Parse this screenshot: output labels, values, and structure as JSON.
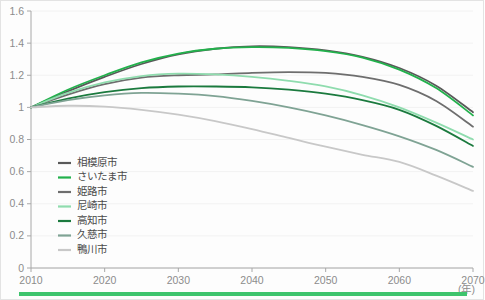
{
  "chart_data": {
    "type": "line",
    "title": "",
    "xlabel": "(年)",
    "ylabel": "",
    "xlim": [
      2010,
      2070
    ],
    "ylim": [
      0,
      1.6
    ],
    "x_ticks": [
      "2010",
      "2020",
      "2030",
      "2040",
      "2050",
      "2060",
      "2070"
    ],
    "x_tick_values": [
      2010,
      2020,
      2030,
      2040,
      2050,
      2060,
      2070
    ],
    "y_ticks": [
      "0",
      "0.2",
      "0.4",
      "0.6",
      "0.8",
      "1",
      "1.2",
      "1.4",
      "1.6"
    ],
    "y_tick_values": [
      0,
      0.2,
      0.4,
      0.6,
      0.8,
      1.0,
      1.2,
      1.4,
      1.6
    ],
    "grid": true,
    "legend_position": "lower-left-inside",
    "x": [
      2010,
      2015,
      2020,
      2025,
      2030,
      2035,
      2040,
      2045,
      2050,
      2055,
      2060,
      2065,
      2070
    ],
    "series": [
      {
        "name": "相模原市",
        "color": "#595959",
        "values": [
          1.0,
          1.1,
          1.19,
          1.27,
          1.33,
          1.365,
          1.38,
          1.375,
          1.355,
          1.315,
          1.245,
          1.135,
          0.97
        ]
      },
      {
        "name": "さいたま市",
        "color": "#22b14c",
        "values": [
          1.0,
          1.11,
          1.2,
          1.28,
          1.335,
          1.365,
          1.375,
          1.37,
          1.35,
          1.31,
          1.235,
          1.12,
          0.95
        ]
      },
      {
        "name": "姫路市",
        "color": "#6e6e6e",
        "values": [
          1.0,
          1.08,
          1.145,
          1.185,
          1.2,
          1.205,
          1.215,
          1.22,
          1.215,
          1.19,
          1.14,
          1.04,
          0.88
        ]
      },
      {
        "name": "尼崎市",
        "color": "#8fdcae",
        "values": [
          1.0,
          1.09,
          1.155,
          1.195,
          1.21,
          1.205,
          1.19,
          1.165,
          1.13,
          1.075,
          1.0,
          0.905,
          0.8
        ]
      },
      {
        "name": "高知市",
        "color": "#1b7a3e",
        "values": [
          1.0,
          1.055,
          1.095,
          1.12,
          1.13,
          1.13,
          1.125,
          1.11,
          1.085,
          1.045,
          0.985,
          0.885,
          0.76
        ]
      },
      {
        "name": "久慈市",
        "color": "#7fa394",
        "values": [
          1.0,
          1.045,
          1.075,
          1.09,
          1.085,
          1.07,
          1.04,
          1.0,
          0.95,
          0.89,
          0.82,
          0.735,
          0.63
        ]
      },
      {
        "name": "鴨川市",
        "color": "#c8c8c8",
        "values": [
          1.0,
          1.01,
          1.005,
          0.985,
          0.955,
          0.915,
          0.865,
          0.81,
          0.755,
          0.705,
          0.66,
          0.575,
          0.48
        ]
      }
    ]
  },
  "legend": {
    "items": [
      {
        "label": "相模原市",
        "color": "#595959"
      },
      {
        "label": "さいたま市",
        "color": "#22b14c"
      },
      {
        "label": "姫路市",
        "color": "#6e6e6e"
      },
      {
        "label": "尼崎市",
        "color": "#8fdcae"
      },
      {
        "label": "高知市",
        "color": "#1b7a3e"
      },
      {
        "label": "久慈市",
        "color": "#7fa394"
      },
      {
        "label": "鴨川市",
        "color": "#c8c8c8"
      }
    ]
  },
  "footer": {
    "accent_color": "#3ec46d"
  }
}
